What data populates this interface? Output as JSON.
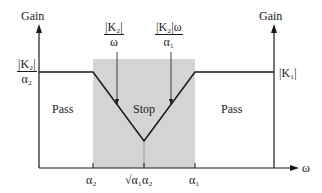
{
  "diagram": {
    "type": "filter-gain-response",
    "left_axis": {
      "title": "Gain"
    },
    "right_axis": {
      "title": "Gain"
    },
    "x_axis": {
      "label": "ω"
    },
    "left_level_label": {
      "numerator": "|K₂|",
      "denominator": "α₂"
    },
    "right_level_label": "|K₁|",
    "annotations": [
      {
        "numerator": "|K₂|",
        "denominator": "ω"
      },
      {
        "numerator": "|K₂|ω",
        "denominator": "α₁"
      }
    ],
    "regions": [
      {
        "label": "Pass"
      },
      {
        "label": "Stop"
      },
      {
        "label": "Pass"
      }
    ],
    "ticks": [
      {
        "label": "α₂"
      },
      {
        "label": "√α₁α₂"
      },
      {
        "label": "α₁"
      }
    ],
    "colors": {
      "stop_band_fill": "#d4d4d4",
      "line": "#1a1a1a",
      "background": "#ffffff"
    }
  }
}
